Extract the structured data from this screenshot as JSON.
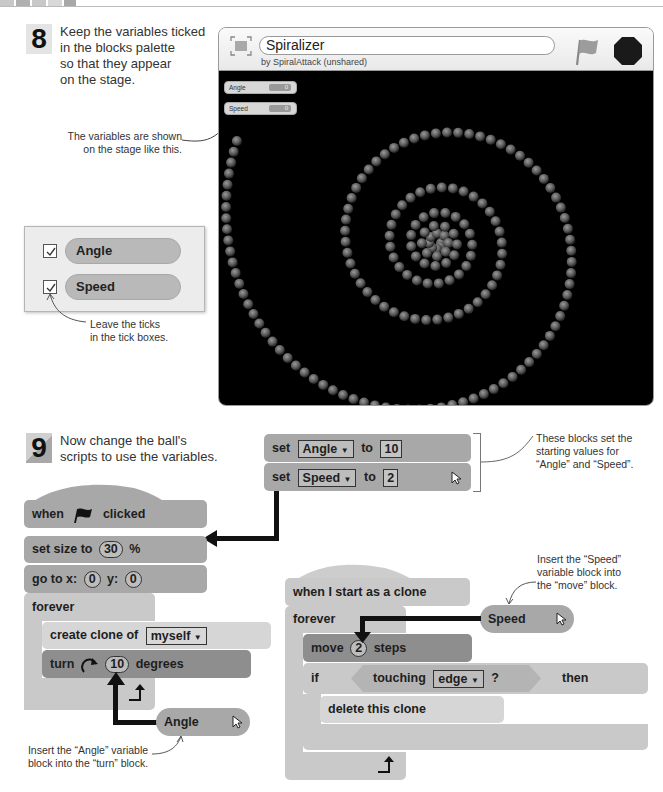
{
  "page": {
    "top_strip": "decorative"
  },
  "step8": {
    "number": "8",
    "text_lines": [
      "Keep the variables ticked",
      "in the blocks palette",
      "so that they appear",
      "on the stage."
    ],
    "caption_stage": [
      "The variables are shown",
      "on the stage like this."
    ],
    "caption_ticks": [
      "Leave the ticks",
      "in the tick boxes."
    ]
  },
  "stage_window": {
    "project_title": "Spiralizer",
    "byline": "by SpiralAttack (unshared)",
    "icons": {
      "fullscreen": "fullscreen-icon",
      "green_flag": "green-flag-icon",
      "stop": "stop-icon"
    },
    "monitors": [
      {
        "label": "Angle",
        "value": "0"
      },
      {
        "label": "Speed",
        "value": "0"
      }
    ]
  },
  "palette": {
    "variables": [
      {
        "name": "Angle",
        "checked": true
      },
      {
        "name": "Speed",
        "checked": true
      }
    ]
  },
  "step9": {
    "number": "9",
    "text_lines": [
      "Now change the ball's",
      "scripts to use the variables."
    ],
    "caption_set": [
      "These blocks set the",
      "starting values for",
      "“Angle” and “Speed”."
    ],
    "caption_angle": [
      "Insert the “Angle” variable",
      "block into the “turn” block."
    ],
    "caption_speed": [
      "Insert the “Speed”",
      "variable block into",
      "the “move” block."
    ]
  },
  "set_blocks": [
    {
      "keyword": "set",
      "variable": "Angle",
      "to": "to",
      "value": "10"
    },
    {
      "keyword": "set",
      "variable": "Speed",
      "to": "to",
      "value": "2"
    }
  ],
  "script_main": {
    "hat": {
      "when": "when",
      "clicked": "clicked"
    },
    "set_size": {
      "label": "set size to",
      "value": "30",
      "unit": "%"
    },
    "go_to": {
      "label": "go to x:",
      "x": "0",
      "y_label": "y:",
      "y": "0"
    },
    "forever": "forever",
    "create_clone": {
      "label": "create clone of",
      "target": "myself"
    },
    "turn": {
      "label": "turn",
      "value": "10",
      "unit": "degrees"
    },
    "reporter": "Angle"
  },
  "script_clone": {
    "hat": "when I start as a clone",
    "forever": "forever",
    "move": {
      "label": "move",
      "value": "2",
      "unit": "steps"
    },
    "if": {
      "if": "if",
      "touching": "touching",
      "target": "edge",
      "q": "?",
      "then": "then"
    },
    "delete": "delete this clone",
    "reporter": "Speed"
  }
}
